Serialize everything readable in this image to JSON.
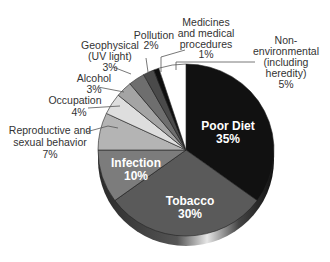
{
  "chart_data": {
    "type": "pie",
    "title": "",
    "categories": [
      "Poor Diet",
      "Tobacco",
      "Infection",
      "Reproductive and sexual behavior",
      "Occupation",
      "Alcohol",
      "Geophysical (UV light)",
      "Pollution",
      "Medicines and medical procedures",
      "Non-environmental (including heredity)"
    ],
    "values": [
      35,
      30,
      10,
      7,
      4,
      3,
      3,
      2,
      1,
      5
    ],
    "colors": [
      "#111111",
      "#5a5a5a",
      "#7c7c7c",
      "#b4b4b4",
      "#dedede",
      "#a4a4a4",
      "#6e6e6e",
      "#4a4a4a",
      "#0e0e0e",
      "#ffffff"
    ],
    "labels": {
      "poor_diet": {
        "name": "Poor Diet",
        "pct": "35%"
      },
      "tobacco": {
        "name": "Tobacco",
        "pct": "30%"
      },
      "infection": {
        "name": "Infection",
        "pct": "10%"
      },
      "reproductive": {
        "line1": "Reproductive and",
        "line2": "sexual behavior",
        "pct": "7%"
      },
      "occupation": {
        "name": "Occupation",
        "pct": "4%"
      },
      "alcohol": {
        "name": "Alcohol",
        "pct": "3%"
      },
      "geophysical": {
        "line1": "Geophysical",
        "line2": "(UV light)",
        "pct": "3%"
      },
      "pollution": {
        "name": "Pollution",
        "pct": "2%"
      },
      "medicines": {
        "line1": "Medicines",
        "line2": "and medical",
        "line3": "procedures",
        "pct": "1%"
      },
      "nonenv": {
        "line1": "Non-",
        "line2": "environmental",
        "line3": "(including",
        "line4": "heredity)",
        "pct": "5%"
      }
    },
    "style": "3d-pie"
  }
}
